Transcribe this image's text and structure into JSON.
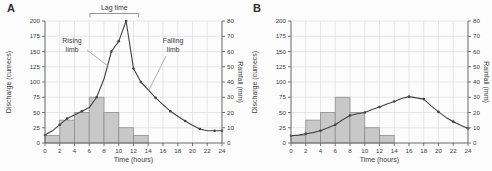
{
  "colors": {
    "bar_fill": "#c8c8c8",
    "bar_stroke": "#8f8f8f",
    "line": "#444444",
    "grid": "#dcdcdc",
    "axis": "#666666",
    "text": "#3c3c3c",
    "leader": "#9c9c9c",
    "bracket": "#8c8c8c"
  },
  "chart_data": [
    {
      "panel_label": "A",
      "type": "combo",
      "title": "",
      "xlabel": "Time (hours)",
      "xlim": [
        0,
        24
      ],
      "x_tick_step": 2,
      "grid": true,
      "legend": "none",
      "left_axis": {
        "label": "Discharge (cumecs)",
        "lim": [
          0,
          200
        ],
        "tick_step": 25
      },
      "right_axis": {
        "label": "Rainfall (mm)",
        "lim": [
          0,
          80
        ],
        "tick_step": 10
      },
      "series": [
        {
          "name": "rainfall",
          "type": "bar",
          "axis": "right",
          "unit": "mm",
          "intervals": [
            [
              0,
              2,
              5
            ],
            [
              2,
              4,
              15
            ],
            [
              4,
              6,
              20
            ],
            [
              6,
              8,
              30
            ],
            [
              8,
              10,
              20
            ],
            [
              10,
              12,
              10
            ],
            [
              12,
              14,
              5
            ]
          ]
        },
        {
          "name": "discharge",
          "type": "line",
          "axis": "left",
          "unit": "cumecs",
          "points": [
            [
              0,
              13
            ],
            [
              1,
              20
            ],
            [
              2,
              30
            ],
            [
              3,
              40
            ],
            [
              4,
              46
            ],
            [
              5,
              52
            ],
            [
              6,
              58
            ],
            [
              7,
              75
            ],
            [
              8,
              105
            ],
            [
              9,
              150
            ],
            [
              10,
              167
            ],
            [
              11,
              200
            ],
            [
              12,
              122
            ],
            [
              13,
              100
            ],
            [
              14,
              87
            ],
            [
              15,
              74
            ],
            [
              16,
              63
            ],
            [
              17,
              52
            ],
            [
              18,
              44
            ],
            [
              19,
              36
            ],
            [
              20,
              29
            ],
            [
              21,
              23
            ],
            [
              22,
              20
            ],
            [
              23,
              20
            ],
            [
              24,
              20
            ]
          ],
          "marker_hours": [
            0,
            2,
            3,
            5,
            7,
            9,
            10,
            11,
            12,
            13,
            15,
            17,
            19,
            21,
            23,
            24
          ]
        }
      ],
      "annotations": [
        {
          "id": "lag-time",
          "kind": "bracket",
          "text": "Lag time",
          "from_hour": 6.1,
          "to_hour": 12.7
        },
        {
          "id": "rising-limb",
          "kind": "leader-label",
          "lines": [
            "Rising",
            "limb"
          ],
          "cx": 72,
          "y": 43,
          "leader": [
            [
              87,
              50
            ],
            [
              108,
              66
            ]
          ]
        },
        {
          "id": "falling-limb",
          "kind": "leader-label",
          "lines": [
            "Falling",
            "limb"
          ],
          "cx": 173,
          "y": 43,
          "leader": [
            [
              166,
              56
            ],
            [
              149,
              90
            ]
          ]
        }
      ]
    },
    {
      "panel_label": "B",
      "type": "combo",
      "title": "",
      "xlabel": "Time (hours)",
      "xlim": [
        0,
        24
      ],
      "x_tick_step": 2,
      "grid": true,
      "legend": "none",
      "left_axis": {
        "label": "Discharge (cumecs)",
        "lim": [
          0,
          200
        ],
        "tick_step": 25
      },
      "right_axis": {
        "label": "Rainfall (mm)",
        "lim": [
          0,
          80
        ],
        "tick_step": 10
      },
      "series": [
        {
          "name": "rainfall",
          "type": "bar",
          "axis": "right",
          "unit": "mm",
          "intervals": [
            [
              0,
              2,
              5
            ],
            [
              2,
              4,
              15
            ],
            [
              4,
              6,
              20
            ],
            [
              6,
              8,
              30
            ],
            [
              8,
              10,
              20
            ],
            [
              10,
              12,
              10
            ],
            [
              12,
              14,
              5
            ]
          ]
        },
        {
          "name": "discharge",
          "type": "line",
          "axis": "left",
          "unit": "cumecs",
          "points": [
            [
              0,
              12
            ],
            [
              1,
              13
            ],
            [
              2,
              15
            ],
            [
              3,
              17
            ],
            [
              4,
              20
            ],
            [
              5,
              25
            ],
            [
              6,
              30
            ],
            [
              7,
              38
            ],
            [
              8,
              45
            ],
            [
              9,
              48
            ],
            [
              10,
              50
            ],
            [
              11,
              55
            ],
            [
              12,
              59
            ],
            [
              13,
              64
            ],
            [
              14,
              68
            ],
            [
              15,
              73
            ],
            [
              16,
              76
            ],
            [
              17,
              74
            ],
            [
              18,
              72
            ],
            [
              19,
              61
            ],
            [
              20,
              51
            ],
            [
              21,
              42
            ],
            [
              22,
              35
            ],
            [
              23,
              29
            ],
            [
              24,
              24
            ]
          ],
          "marker_hours": [
            0,
            2,
            4,
            6,
            8,
            10,
            12,
            14,
            16,
            18,
            20,
            22,
            24
          ]
        }
      ],
      "annotations": []
    }
  ]
}
